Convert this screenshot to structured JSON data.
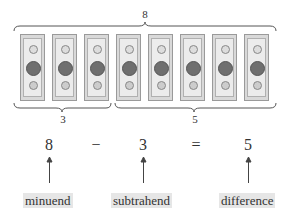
{
  "diagram": {
    "total_label": "8",
    "left_group_label": "3",
    "right_group_label": "5",
    "bill_count": 8,
    "bill_icon": "dollar-bill-icon",
    "equation": {
      "minuend": "8",
      "minus": "−",
      "subtrahend": "3",
      "equals": "=",
      "difference": "5"
    },
    "terms": {
      "minuend": "minuend",
      "subtrahend": "subtrahend",
      "difference": "difference"
    },
    "colors": {
      "term_background": "#e6e6e6",
      "text": "#333333"
    }
  }
}
